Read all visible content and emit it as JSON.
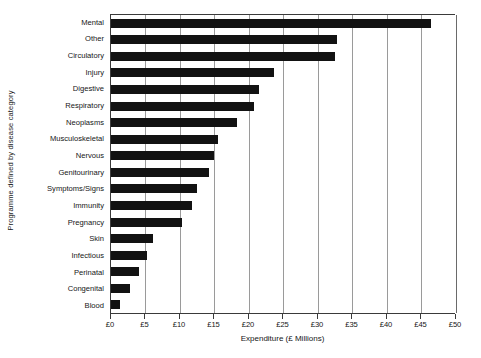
{
  "chart_data": {
    "type": "bar",
    "orientation": "horizontal",
    "title": "",
    "xlabel": "Expenditure (£ Millions)",
    "ylabel": "Programme defined by disease category",
    "xlim": [
      0,
      50
    ],
    "xticks": [
      0,
      5,
      10,
      15,
      20,
      25,
      30,
      35,
      40,
      45,
      50
    ],
    "xticklabels": [
      "£0",
      "£5",
      "£10",
      "£15",
      "£20",
      "£25",
      "£30",
      "£35",
      "£40",
      "£45",
      "£50"
    ],
    "grid": "vertical",
    "legend": "none",
    "bar_color": "#121212",
    "categories": [
      "Mental",
      "Other",
      "Circulatory",
      "Injury",
      "Digestive",
      "Respiratory",
      "Neoplasms",
      "Musculoskeletal",
      "Nervous",
      "Genitourinary",
      "Symptoms/Signs",
      "Immunity",
      "Pregnancy",
      "Skin",
      "Infectious",
      "Perinatal",
      "Congenital",
      "Blood"
    ],
    "values": [
      46.4,
      32.8,
      32.4,
      23.6,
      21.4,
      20.7,
      18.3,
      15.5,
      14.9,
      14.2,
      12.5,
      11.7,
      10.3,
      6.1,
      5.2,
      4.0,
      2.7,
      1.3
    ]
  }
}
